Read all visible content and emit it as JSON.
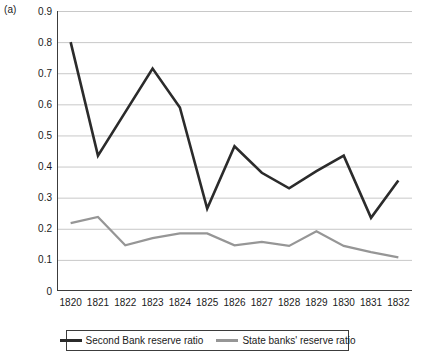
{
  "panel": {
    "label": "(a)"
  },
  "chart_data": {
    "type": "line",
    "title": "",
    "subtitle": "",
    "xlabel": "",
    "ylabel": "",
    "categories": [
      "1820",
      "1821",
      "1822",
      "1823",
      "1824",
      "1825",
      "1826",
      "1827",
      "1828",
      "1829",
      "1830",
      "1831",
      "1832"
    ],
    "x": [
      1820,
      1821,
      1822,
      1823,
      1824,
      1825,
      1826,
      1827,
      1828,
      1829,
      1830,
      1831,
      1832
    ],
    "ylim": [
      0,
      0.9
    ],
    "yticks": [
      "0",
      "0.1",
      "0.2",
      "0.3",
      "0.4",
      "0.5",
      "0.6",
      "0.7",
      "0.8",
      "0.9"
    ],
    "ytick_values": [
      0,
      0.1,
      0.2,
      0.3,
      0.4,
      0.5,
      0.6,
      0.7,
      0.8,
      0.9
    ],
    "grid": "horizontal",
    "legend_position": "bottom",
    "series": [
      {
        "name": "Second Bank reserve ratio",
        "color": "#2b2b2b",
        "values": [
          0.8,
          0.435,
          0.575,
          0.715,
          0.59,
          0.265,
          0.465,
          0.38,
          0.33,
          0.385,
          0.435,
          0.235,
          0.355
        ]
      },
      {
        "name": "State banks' reserve ratio",
        "color": "#969696",
        "values": [
          0.218,
          0.238,
          0.147,
          0.17,
          0.185,
          0.185,
          0.147,
          0.158,
          0.145,
          0.192,
          0.145,
          0.125,
          0.108
        ]
      }
    ]
  },
  "legend": {
    "items": [
      {
        "label": "Second Bank reserve ratio"
      },
      {
        "label": "State banks' reserve ratio"
      }
    ]
  },
  "colors": {
    "axis": "#3c3c3c",
    "grid": "#c8c8c8",
    "series_dark": "#2b2b2b",
    "series_gray": "#969696",
    "background": "#ffffff"
  }
}
